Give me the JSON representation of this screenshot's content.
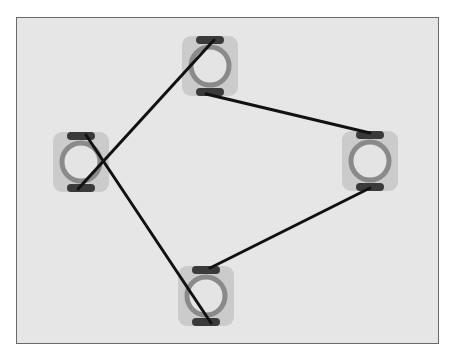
{
  "diagram": {
    "type": "node-link graph",
    "colors": {
      "background": "#e6e6e6",
      "frame_border": "#6a6a6a",
      "node_tile": "#cbcbcb",
      "node_ring": "#8a8a8a",
      "node_ring_fill": "#e4e4e4",
      "connector_pad": "#3a3a3a",
      "edge": "#111111"
    },
    "nodes": [
      {
        "id": "top",
        "cx": 210,
        "cy": 66
      },
      {
        "id": "left",
        "cx": 81,
        "cy": 162
      },
      {
        "id": "right",
        "cx": 370,
        "cy": 161
      },
      {
        "id": "bottom",
        "cx": 206,
        "cy": 296
      }
    ],
    "edges": [
      {
        "from": "top.top_pad",
        "to": "left.bottom_pad",
        "x1": 214,
        "y1": 40,
        "x2": 78,
        "y2": 189
      },
      {
        "from": "top.bottom_pad",
        "to": "right.top_pad",
        "x1": 206,
        "y1": 94,
        "x2": 370,
        "y2": 133
      },
      {
        "from": "left.top_pad",
        "to": "bottom.bottom_pad",
        "x1": 86,
        "y1": 135,
        "x2": 211,
        "y2": 323
      },
      {
        "from": "right.bottom_pad",
        "to": "bottom.top_pad",
        "x1": 370,
        "y1": 188,
        "x2": 210,
        "y2": 268
      }
    ]
  }
}
